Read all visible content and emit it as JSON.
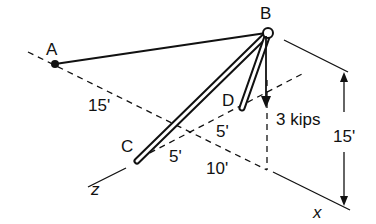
{
  "diagram": {
    "type": "3D truss/boom structure (statics problem)",
    "points": {
      "A": "A",
      "B": "B",
      "C": "C",
      "D": "D"
    },
    "load": {
      "label": "3 kips",
      "direction": "downward at B"
    },
    "dimensions": {
      "a_to_origin": "15'",
      "c_to_d": "5'",
      "d_to_origin": "5'",
      "origin_to_x": "10'",
      "height": "15'"
    },
    "axes": {
      "x": "x",
      "z": "z"
    },
    "colors": {
      "ink": "#111111",
      "background": "#ffffff"
    }
  }
}
